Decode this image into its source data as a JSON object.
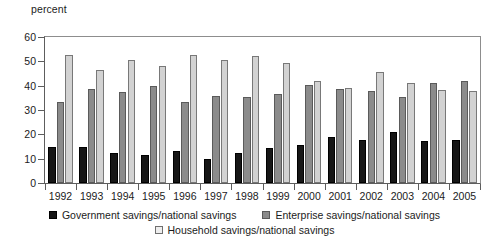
{
  "chart_data": {
    "type": "bar",
    "title": "",
    "subtitle": "",
    "xlabel": "",
    "ylabel": "percent",
    "ylim": [
      0,
      60
    ],
    "yticks": [
      0,
      10,
      20,
      30,
      40,
      50,
      60
    ],
    "grid": false,
    "legend_position": "bottom",
    "categories": [
      "1992",
      "1993",
      "1994",
      "1995",
      "1996",
      "1997",
      "1998",
      "1999",
      "2000",
      "2001",
      "2002",
      "2003",
      "2004",
      "2005"
    ],
    "series": [
      {
        "name": "Government savings/national savings",
        "color": "#161616",
        "values": [
          14.8,
          15.0,
          12.2,
          11.4,
          13.3,
          10.0,
          12.5,
          14.2,
          15.8,
          19.0,
          17.6,
          20.8,
          17.3,
          17.6
        ]
      },
      {
        "name": "Enterprise savings/national savings",
        "color": "#8b8b8b",
        "values": [
          33.2,
          38.7,
          37.4,
          39.9,
          33.4,
          35.6,
          35.2,
          36.5,
          40.4,
          38.5,
          37.9,
          35.3,
          41.2,
          42.0
        ]
      },
      {
        "name": "Household savings/national savings",
        "color": "#d2d2d2",
        "values": [
          52.5,
          46.4,
          50.4,
          48.0,
          52.7,
          50.4,
          52.3,
          49.3,
          42.1,
          38.9,
          45.7,
          41.2,
          38.4,
          37.9
        ]
      }
    ]
  },
  "axis": {
    "unit_label": "percent"
  },
  "legend": {
    "items": [
      {
        "label": "Government savings/national savings",
        "swatch": "legend-swatch-government"
      },
      {
        "label": "Enterprise savings/national savings",
        "swatch": "legend-swatch-enterprise"
      },
      {
        "label": "Household savings/national savings",
        "swatch": "legend-swatch-household"
      }
    ]
  }
}
